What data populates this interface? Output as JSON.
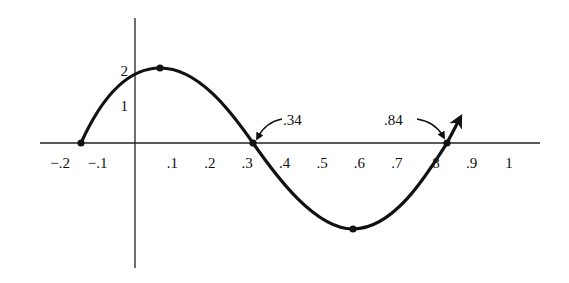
{
  "chart_data": {
    "type": "line",
    "title": "",
    "xlabel": "",
    "ylabel": "",
    "x_tick_labels": [
      "−.2",
      "−.1",
      ".1",
      ".2",
      ".3",
      ".4",
      ".5",
      ".6",
      ".7",
      ".8",
      ".9",
      "1"
    ],
    "x_ticks": [
      -0.2,
      -0.1,
      0.1,
      0.2,
      0.3,
      0.4,
      0.5,
      0.6,
      0.7,
      0.8,
      0.9,
      1.0
    ],
    "y_tick_labels": [
      "2",
      "1"
    ],
    "y_ticks": [
      2,
      1
    ],
    "xlim": [
      -0.27,
      1.05
    ],
    "ylim": [
      -2.3,
      3.3
    ],
    "grid": false,
    "legend": null,
    "key_points": [
      {
        "x": -0.16,
        "y": 0,
        "label": "zero"
      },
      {
        "x": 0.09,
        "y": 2,
        "label": "maximum"
      },
      {
        "x": 0.34,
        "y": 0,
        "label": "zero"
      },
      {
        "x": 0.59,
        "y": -2,
        "label": "minimum"
      },
      {
        "x": 0.84,
        "y": 0,
        "label": "zero"
      }
    ],
    "annotations": [
      {
        "text": ".34",
        "points_to": {
          "x": 0.34,
          "y": 0
        }
      },
      {
        "text": ".84",
        "points_to": {
          "x": 0.84,
          "y": 0
        }
      }
    ],
    "series": [
      {
        "name": "y = 2 sin(2π(x + 0.16))",
        "x": [
          -0.16,
          -0.1,
          -0.03,
          0.09,
          0.2,
          0.34,
          0.46,
          0.59,
          0.7,
          0.84,
          0.88
        ],
        "values": [
          0,
          1.1,
          1.7,
          2,
          1.6,
          0,
          -1.45,
          -2,
          -1.6,
          0,
          0.5
        ],
        "end_arrow": true
      }
    ]
  },
  "labels": {
    "annot_034": ".34",
    "annot_084": ".84"
  }
}
